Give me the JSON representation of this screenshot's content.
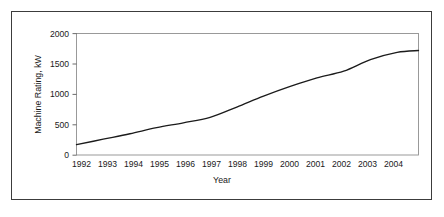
{
  "figure": {
    "background_color": "#ffffff",
    "frame_color": "#3c3c3c",
    "plot_border_color": "#8f8f8f",
    "line_color": "#1b1b1b"
  },
  "chart_data": {
    "type": "line",
    "title": "",
    "xlabel": "Year",
    "ylabel": "Machine Rating, kW",
    "xlim": [
      1992,
      2004.8
    ],
    "ylim": [
      0,
      2000
    ],
    "grid": false,
    "legend": null,
    "x_tick_labels": [
      "1992",
      "1993",
      "1994",
      "1995",
      "1996",
      "1997",
      "1998",
      "1999",
      "2000",
      "2001",
      "2002",
      "2003",
      "2004"
    ],
    "y_tick_labels": [
      "0",
      "500",
      "1000",
      "1500",
      "2000"
    ],
    "y_ticks": [
      0,
      500,
      1000,
      1500,
      2000
    ],
    "series": [
      {
        "name": "Machine Rating",
        "x": [
          1992,
          1993,
          1994,
          1995,
          1996,
          1997,
          1998,
          1999,
          2000,
          2001,
          2002,
          2003,
          2004,
          2004.8
        ],
        "values": [
          170,
          260,
          350,
          450,
          530,
          620,
          790,
          970,
          1130,
          1270,
          1380,
          1570,
          1690,
          1720
        ]
      }
    ]
  }
}
